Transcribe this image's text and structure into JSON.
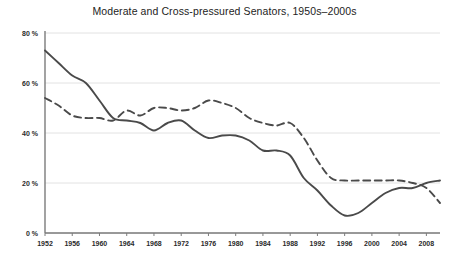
{
  "chart_data": {
    "type": "line",
    "title": "Moderate and Cross-pressured Senators, 1950s–2000s",
    "xlabel": "",
    "ylabel": "",
    "xlim": [
      1952,
      2010
    ],
    "ylim": [
      0,
      80
    ],
    "grid": true,
    "legend_position": "none",
    "ytick_labels": [
      "0 %",
      "20 %",
      "40 %",
      "60 %",
      "80 %"
    ],
    "ytick_values": [
      0,
      20,
      40,
      60,
      80
    ],
    "xtick_labels": [
      "1952",
      "1956",
      "1960",
      "1964",
      "1968",
      "1972",
      "1976",
      "1980",
      "1984",
      "1988",
      "1992",
      "1996",
      "2000",
      "2004",
      "2008"
    ],
    "xtick_values": [
      1952,
      1956,
      1960,
      1964,
      1968,
      1972,
      1976,
      1980,
      1984,
      1988,
      1992,
      1996,
      2000,
      2004,
      2008
    ],
    "series": [
      {
        "name": "Moderate Senators",
        "style": "solid",
        "color": "#4a4a4a",
        "x": [
          1952,
          1954,
          1956,
          1958,
          1960,
          1962,
          1964,
          1966,
          1968,
          1970,
          1972,
          1974,
          1976,
          1978,
          1980,
          1982,
          1984,
          1986,
          1988,
          1990,
          1992,
          1994,
          1996,
          1998,
          2000,
          2002,
          2004,
          2006,
          2008,
          2010
        ],
        "values": [
          73,
          68,
          63,
          60,
          53,
          46,
          45,
          44,
          41,
          44,
          45,
          41,
          38,
          39,
          39,
          37,
          33,
          33,
          31,
          22,
          17,
          11,
          7,
          8,
          12,
          16,
          18,
          18,
          20,
          21
        ]
      },
      {
        "name": "Cross-pressured Senators",
        "style": "dashed",
        "color": "#4a4a4a",
        "x": [
          1952,
          1954,
          1956,
          1958,
          1960,
          1962,
          1964,
          1966,
          1968,
          1970,
          1972,
          1974,
          1976,
          1978,
          1980,
          1982,
          1984,
          1986,
          1988,
          1990,
          1992,
          1994,
          1996,
          1998,
          2000,
          2002,
          2004,
          2006,
          2008,
          2010
        ],
        "values": [
          54,
          51,
          47,
          46,
          46,
          45,
          49,
          47,
          50,
          50,
          49,
          50,
          53,
          52,
          50,
          46,
          44,
          43,
          44,
          38,
          29,
          22,
          21,
          21,
          21,
          21,
          21,
          20,
          18,
          12
        ]
      }
    ]
  }
}
